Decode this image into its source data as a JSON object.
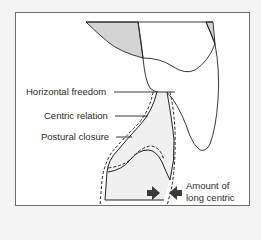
{
  "diagram": {
    "type": "dental occlusion schematic (sagittal tooth contact)",
    "labels": {
      "horizontal_freedom": "Horizontal freedom",
      "centric_relation": "Centric relation",
      "postural_closure": "Postural closure",
      "amount_line1": "Amount of",
      "amount_line2": "long centric"
    },
    "colors": {
      "background": "#f4f4f4",
      "frame_fill": "#ffffff",
      "frame_border": "#6e6e6e",
      "stroke": "#222222",
      "shaded_fill": "#d4d4d4",
      "light_fill": "#ececec",
      "arrow_fill": "#3a3a3a"
    },
    "legend": {
      "solid_line": "Postural closure / tooth outline",
      "dashed_line": "Centric relation"
    }
  }
}
